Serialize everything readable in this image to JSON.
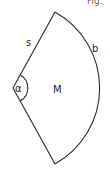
{
  "figure": {
    "caption_fragment": "Fig.",
    "shape": "circular-sector",
    "labels": {
      "side": "s",
      "arc": "b",
      "angle": "α",
      "center": "M"
    },
    "colors": {
      "stroke": "#2a2a2a",
      "background": "#ffffff"
    }
  }
}
